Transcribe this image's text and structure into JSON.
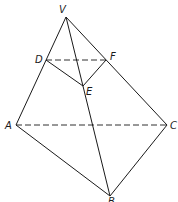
{
  "diagram": {
    "type": "geometry-pyramid",
    "points": {
      "V": {
        "label": "V",
        "x": 66,
        "y": 17,
        "lx": 59,
        "ly": 13
      },
      "D": {
        "label": "D",
        "x": 46,
        "y": 60,
        "lx": 35,
        "ly": 63
      },
      "F": {
        "label": "F",
        "x": 106,
        "y": 60,
        "lx": 110,
        "ly": 60
      },
      "E": {
        "label": "E",
        "x": 83,
        "y": 86,
        "lx": 86,
        "ly": 95
      },
      "A": {
        "label": "A",
        "x": 16,
        "y": 125,
        "lx": 5,
        "ly": 129
      },
      "C": {
        "label": "C",
        "x": 167,
        "y": 125,
        "lx": 170,
        "ly": 129
      },
      "B": {
        "label": "B",
        "x": 110,
        "y": 196,
        "lx": 108,
        "ly": 205
      }
    },
    "solid_edges": [
      [
        "V",
        "A"
      ],
      [
        "V",
        "C"
      ],
      [
        "V",
        "B"
      ],
      [
        "A",
        "B"
      ],
      [
        "C",
        "B"
      ],
      [
        "D",
        "E"
      ],
      [
        "E",
        "F"
      ]
    ],
    "dashed_edges": [
      [
        "D",
        "F"
      ],
      [
        "A",
        "C"
      ]
    ],
    "stroke_color": "#1a1a1a"
  }
}
